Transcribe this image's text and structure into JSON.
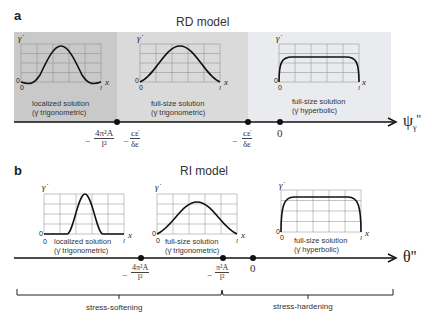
{
  "panel_a": {
    "label": "a",
    "title": "RD model",
    "axis_label": "ψ",
    "axis_sub": "γ",
    "axis_prime": "''",
    "regions": [
      {
        "caption_line1": "localized solution",
        "caption_line2": "(γ̇ trigonometric)",
        "curve": "localized-bump",
        "bg": "#c8c8c8"
      },
      {
        "caption_line1": "full-size solution",
        "caption_line2": "(γ̇ trigonometric)",
        "curve": "full-sine",
        "bg": "#dcdcdc"
      },
      {
        "caption_line1": "full-size solution",
        "caption_line2": "(γ̇ hyperbolic)",
        "curve": "plateau",
        "bg": "#eaecef"
      }
    ],
    "ticks": [
      {
        "neg": "−",
        "num": "4π²A",
        "den": "l²",
        "neg2": "−",
        "num2": "cε̇",
        "den2": "δε"
      },
      {
        "neg": "−",
        "num": "cε̇",
        "den": "δε"
      },
      {
        "value": "0"
      }
    ]
  },
  "panel_b": {
    "label": "b",
    "title": "RI model",
    "axis_label": "θ''",
    "regions": [
      {
        "caption_line1": "localized solution",
        "caption_line2": "(γ̇ trigonometric)",
        "curve": "narrow-bump",
        "bg": "#eceef0"
      },
      {
        "caption_line1": "full-size solution",
        "caption_line2": "(γ̇ trigonometric)",
        "curve": "full-sine",
        "bg": "#dcdcdc"
      },
      {
        "caption_line1": "full-size solution",
        "caption_line2": "(γ̇ hyperbolic)",
        "curve": "plateau",
        "bg": "#c6c6c6"
      }
    ],
    "ticks": [
      {
        "neg": "−",
        "num": "4π²A",
        "den": "l²"
      },
      {
        "neg": "−",
        "num": "π²A",
        "den": "l²"
      },
      {
        "value": "0"
      }
    ],
    "brackets": [
      {
        "label": "stress-softening"
      },
      {
        "label": "stress-hardening"
      }
    ]
  },
  "plot_labels": {
    "y": "γ̇",
    "x": "x",
    "origin": "0",
    "xmax": "l",
    "y0": "0"
  }
}
